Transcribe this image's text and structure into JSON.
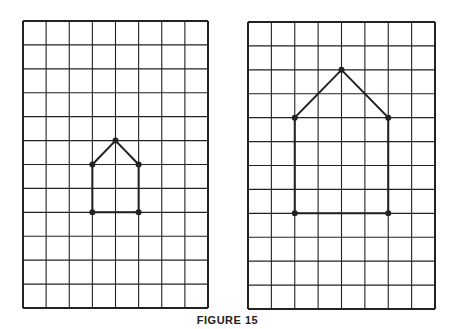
{
  "caption": "FIGURE 15",
  "colors": {
    "line": "#222222",
    "background": "#ffffff"
  },
  "grids": [
    {
      "name": "small-grid",
      "x": 23,
      "y": 21,
      "width": 185,
      "height": 287,
      "cols": 8,
      "rows": 12,
      "shape": [
        [
          4,
          5
        ],
        [
          5,
          6
        ],
        [
          5,
          8
        ],
        [
          3,
          8
        ],
        [
          3,
          6
        ]
      ]
    },
    {
      "name": "large-grid",
      "x": 248,
      "y": 22,
      "width": 187,
      "height": 287,
      "cols": 8,
      "rows": 12,
      "shape": [
        [
          4,
          2
        ],
        [
          6,
          4
        ],
        [
          6,
          8
        ],
        [
          2,
          8
        ],
        [
          2,
          4
        ]
      ]
    }
  ]
}
